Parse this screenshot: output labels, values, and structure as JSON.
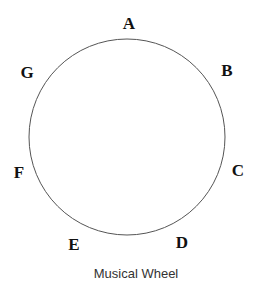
{
  "diagram": {
    "caption": "Musical Wheel",
    "circle": {
      "cx": 127,
      "cy": 137,
      "r": 98,
      "stroke": "#555555"
    },
    "notes": [
      {
        "label": "A",
        "x": 129,
        "y": 29
      },
      {
        "label": "B",
        "x": 227,
        "y": 76
      },
      {
        "label": "C",
        "x": 238,
        "y": 176
      },
      {
        "label": "D",
        "x": 182,
        "y": 248
      },
      {
        "label": "E",
        "x": 74,
        "y": 250
      },
      {
        "label": "F",
        "x": 19,
        "y": 178
      },
      {
        "label": "G",
        "x": 27,
        "y": 78
      }
    ]
  }
}
